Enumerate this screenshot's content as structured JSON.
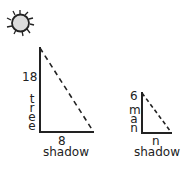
{
  "figure": {
    "sun": {
      "icon": "sun-icon",
      "fill": "#dcdcdc",
      "stroke": "#222222"
    },
    "tree_triangle": {
      "height_value": "18",
      "height_label": "tree",
      "base_value": "8",
      "base_label": "shadow"
    },
    "man_triangle": {
      "height_value": "6",
      "height_label": "man",
      "base_value": "n",
      "base_label": "shadow"
    },
    "line_color": "#222222"
  }
}
